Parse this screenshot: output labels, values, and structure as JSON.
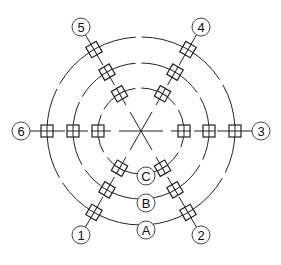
{
  "diagram": {
    "type": "radial-axis-grid",
    "colors": {
      "line": "#222222",
      "background": "#ffffff",
      "label_circle": "#444444"
    },
    "center": {
      "x": 141,
      "y": 131
    },
    "rings": [
      {
        "id": "C",
        "label": "C",
        "radius": 43
      },
      {
        "id": "B",
        "label": "B",
        "radius": 68
      },
      {
        "id": "A",
        "label": "A",
        "radius": 94
      }
    ],
    "radial_axes": [
      {
        "id": "1",
        "label": "1",
        "angle_deg": 120
      },
      {
        "id": "2",
        "label": "2",
        "angle_deg": 60
      },
      {
        "id": "3",
        "label": "3",
        "angle_deg": 0
      },
      {
        "id": "4",
        "label": "4",
        "angle_deg": -60
      },
      {
        "id": "5",
        "label": "5",
        "angle_deg": -120
      },
      {
        "id": "6",
        "label": "6",
        "angle_deg": 180
      }
    ],
    "axis_label_radius": 120,
    "node_symbol": "square-with-cross",
    "ring_label_positions": [
      {
        "label": "C",
        "x": 146,
        "y": 176
      },
      {
        "label": "B",
        "x": 146,
        "y": 203
      },
      {
        "label": "A",
        "x": 146,
        "y": 230
      }
    ]
  }
}
